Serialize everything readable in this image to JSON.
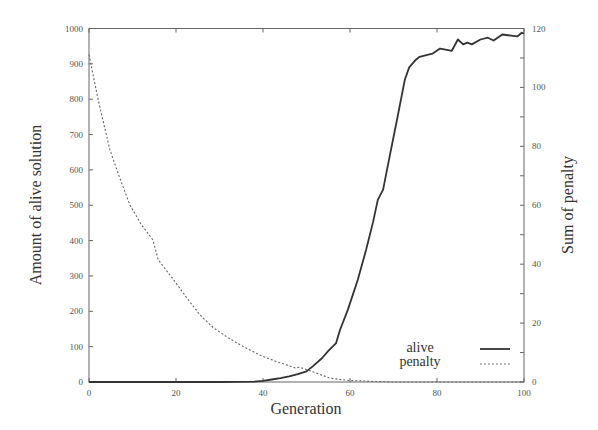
{
  "chart_data": {
    "type": "line",
    "title": "",
    "xlabel": "Generation",
    "ylabel": "Amount of alive solution",
    "ylabel_right": "Sum of penalty",
    "xlim": [
      0,
      100
    ],
    "ylim": [
      0,
      1000
    ],
    "ylim_right": [
      0,
      120
    ],
    "x_ticks": [
      0,
      20,
      40,
      60,
      80,
      100
    ],
    "y_ticks": [
      0,
      100,
      200,
      300,
      400,
      500,
      600,
      700,
      800,
      900,
      1000
    ],
    "y_ticks_right": [
      0,
      20,
      40,
      60,
      80,
      100,
      120
    ],
    "grid": false,
    "legend_position": "lower right",
    "series": [
      {
        "name": "alive",
        "axis": "left",
        "style": "solid",
        "color": "#333333",
        "x": [
          0,
          10,
          20,
          30,
          38,
          40,
          42,
          44,
          46,
          48,
          50,
          51.5,
          53.6,
          55,
          56.8,
          57.7,
          59.5,
          61.8,
          63.7,
          65.3,
          66.4,
          67.6,
          69.2,
          70.8,
          72.6,
          73.6,
          75,
          76,
          78,
          79,
          80.7,
          82,
          83.4,
          84.8,
          86,
          87,
          88,
          90,
          91.7,
          93,
          95,
          97,
          98.5,
          99.5,
          100
        ],
        "values": [
          0,
          0,
          0,
          0,
          1,
          3,
          7,
          11,
          16,
          22,
          30,
          45,
          68,
          88,
          110,
          147,
          204,
          289,
          374,
          453,
          515,
          544,
          643,
          742,
          855,
          890,
          910,
          920,
          926,
          929,
          943,
          940,
          937,
          969,
          955,
          960,
          955,
          969,
          974,
          966,
          983,
          980,
          978,
          988,
          985
        ]
      },
      {
        "name": "penalty",
        "axis": "right",
        "style": "dashed",
        "color": "#666666",
        "x": [
          0,
          2.1,
          4.8,
          7,
          9.4,
          12,
          14.7,
          15.9,
          19.8,
          22.5,
          25.5,
          28.5,
          32,
          35.5,
          39.3,
          43,
          47.4,
          48.5,
          52,
          55.4,
          58,
          60,
          62.3,
          65,
          70,
          80,
          90,
          100
        ],
        "values": [
          111.1,
          95.9,
          78.8,
          69.5,
          60.1,
          53.5,
          48.2,
          41.5,
          34.0,
          28.5,
          22.8,
          18.5,
          15.0,
          12.0,
          9.1,
          7.0,
          4.8,
          5.0,
          3.2,
          1.3,
          0.8,
          0.5,
          0.4,
          0.2,
          0,
          0,
          0,
          0
        ]
      }
    ],
    "legend": [
      {
        "label": "alive",
        "style": "solid"
      },
      {
        "label": "penalty",
        "style": "dashed"
      }
    ]
  },
  "labels": {
    "xlabel": "Generation",
    "ylabel": "Amount of alive solution",
    "ylabel_right": "Sum of penalty",
    "legend_alive": "alive",
    "legend_penalty": "penalty"
  }
}
